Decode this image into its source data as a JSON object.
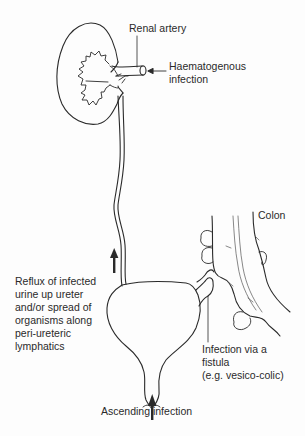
{
  "diagram": {
    "type": "anatomical-illustration",
    "structures": [
      "kidney",
      "renal artery",
      "ureter",
      "bladder",
      "urethra",
      "colon",
      "fistula"
    ],
    "colors": {
      "line": "#2a2a2a",
      "background": "#fdfdfd"
    }
  },
  "labels": {
    "renal_artery": "Renal artery",
    "haematogenous": [
      "Haematogenous",
      "infection"
    ],
    "colon": "Colon",
    "reflux": [
      "Reflux of infected",
      "urine up ureter",
      "and/or spread of",
      "organisms along",
      "peri-ureteric",
      "lymphatics"
    ],
    "fistula": [
      "Infection via a",
      "fistula",
      "(e.g. vesico-colic)"
    ],
    "ascending": "Ascending infection"
  },
  "arrows": [
    {
      "name": "haematogenous-arrow",
      "direction": "left",
      "points_to": "renal artery"
    },
    {
      "name": "reflux-arrow",
      "direction": "up",
      "points_to": "ureter"
    },
    {
      "name": "ascending-arrow",
      "direction": "up",
      "points_to": "urethra"
    }
  ]
}
